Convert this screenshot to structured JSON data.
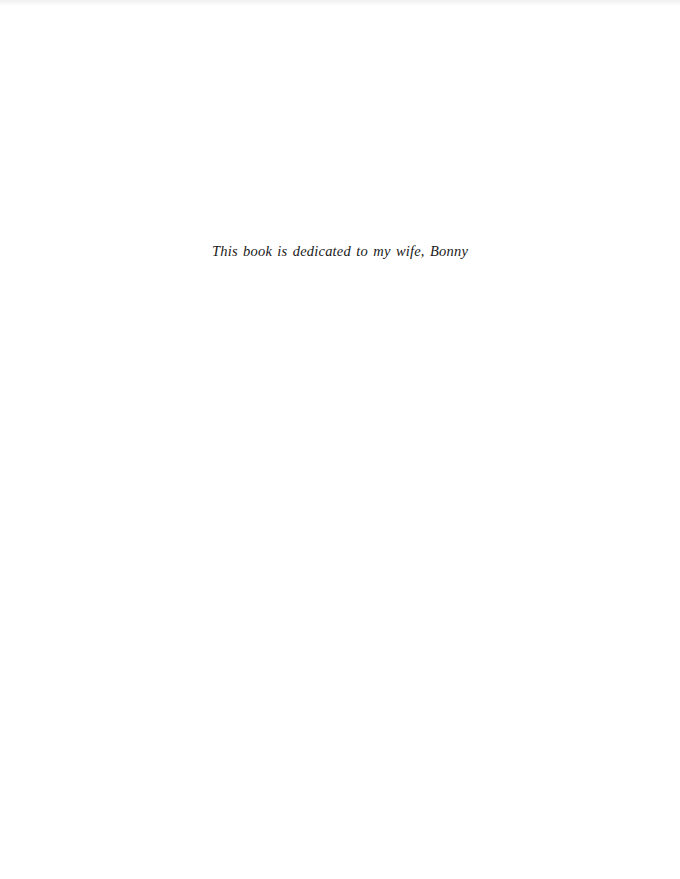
{
  "page": {
    "dedication": "This book is dedicated to my wife, Bonny"
  }
}
